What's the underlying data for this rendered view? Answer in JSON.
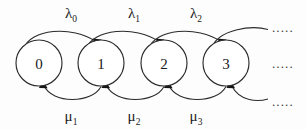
{
  "diagram": {
    "type": "state-transition-chain",
    "background_color": "#fdfdfd",
    "stroke_color": "#2b2b2b",
    "text_color": "#1a1a1a",
    "states": [
      {
        "id": "s0",
        "label": "0",
        "cx": 39,
        "cy": 63,
        "r": 23
      },
      {
        "id": "s1",
        "label": "1",
        "cx": 101,
        "cy": 63,
        "r": 23
      },
      {
        "id": "s2",
        "label": "2",
        "cx": 164,
        "cy": 63,
        "r": 23
      },
      {
        "id": "s3",
        "label": "3",
        "cx": 226,
        "cy": 63,
        "r": 23
      }
    ],
    "forward_transitions": [
      {
        "id": "t01",
        "from": "0",
        "to": "1",
        "symbol": "λ",
        "subscript": "0",
        "label_x": 71,
        "label_y": 18
      },
      {
        "id": "t12",
        "from": "1",
        "to": "2",
        "symbol": "λ",
        "subscript": "1",
        "label_x": 134,
        "label_y": 18
      },
      {
        "id": "t23",
        "from": "2",
        "to": "3",
        "symbol": "λ",
        "subscript": "2",
        "label_x": 196,
        "label_y": 18
      },
      {
        "id": "t3x",
        "from": "3",
        "to": "...",
        "symbol": "",
        "subscript": "",
        "label_x": 0,
        "label_y": 0
      }
    ],
    "backward_transitions": [
      {
        "id": "t10",
        "from": "1",
        "to": "0",
        "symbol": "μ",
        "subscript": "1",
        "label_x": 71,
        "label_y": 122
      },
      {
        "id": "t21",
        "from": "2",
        "to": "1",
        "symbol": "μ",
        "subscript": "2",
        "label_x": 134,
        "label_y": 122
      },
      {
        "id": "t32",
        "from": "3",
        "to": "2",
        "symbol": "μ",
        "subscript": "3",
        "label_x": 196,
        "label_y": 122
      },
      {
        "id": "tx3",
        "from": "...",
        "to": "3",
        "symbol": "",
        "subscript": "",
        "label_x": 0,
        "label_y": 0
      }
    ],
    "continuations": [
      {
        "id": "top-ellipsis",
        "text": ".....",
        "x": 272,
        "y": 32
      },
      {
        "id": "middle-ellipsis",
        "text": ".....",
        "x": 272,
        "y": 68
      },
      {
        "id": "bottom-ellipsis",
        "text": ".....",
        "x": 272,
        "y": 105
      }
    ]
  }
}
